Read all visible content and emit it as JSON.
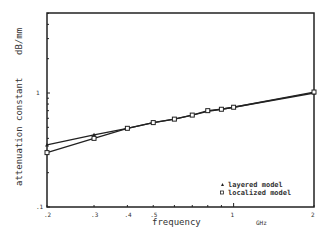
{
  "chart_data": {
    "type": "line",
    "title": "",
    "xlabel": "frequency",
    "xunit": "GHz",
    "ylabel": "attenuation constant",
    "yunit": "dB/mm",
    "xscale": "log",
    "yscale": "log",
    "xlim": [
      0.2,
      2
    ],
    "ylim": [
      0.1,
      5
    ],
    "x_ticks": [
      ".2",
      ".3",
      ".4",
      ".5",
      "1",
      "2"
    ],
    "y_ticks": [
      ".1",
      "1"
    ],
    "grid": false,
    "legend_position": "lower right",
    "x": [
      0.2,
      0.3,
      0.4,
      0.5,
      0.6,
      0.7,
      0.8,
      0.9,
      1.0,
      2.0
    ],
    "series": [
      {
        "name": "layered model",
        "marker": "triangle",
        "values": [
          0.35,
          0.43,
          0.49,
          0.55,
          0.59,
          0.64,
          0.69,
          0.72,
          0.75,
          1.0
        ]
      },
      {
        "name": "localized model",
        "marker": "square",
        "values": [
          0.3,
          0.4,
          0.49,
          0.55,
          0.59,
          0.64,
          0.7,
          0.72,
          0.75,
          1.02
        ]
      }
    ]
  },
  "labels": {
    "xlabel": "frequency",
    "xunit": "GHz",
    "ylabel": "attenuation constant",
    "yunit": "dB/mm",
    "legend_layered": "layered model",
    "legend_localized": "localized model"
  }
}
